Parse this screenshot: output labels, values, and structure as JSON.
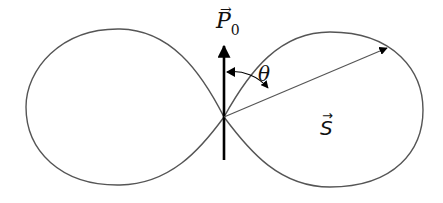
{
  "diagram": {
    "type": "dipole radiation pattern",
    "labels": {
      "dipole_moment": "P",
      "dipole_subscript": "0",
      "vector_arrow": "→",
      "angle": "θ",
      "poynting_vector": "S"
    },
    "colors": {
      "curve": "#555555",
      "arrow": "#000000",
      "text": "#111111"
    }
  }
}
